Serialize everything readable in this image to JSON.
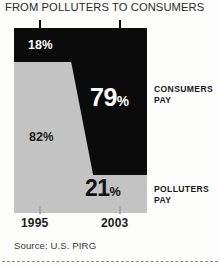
{
  "title": "FROM POLLUTERS TO CONSUMERS",
  "source": "Source: U.S. PIRG",
  "callouts": {
    "consumers_line1": "CONSUMERS",
    "consumers_line2": "PAY",
    "polluters_line1": "POLLUTERS",
    "polluters_line2": "PAY"
  },
  "axis": {
    "year_start": "1995",
    "year_end": "2003"
  },
  "labels": {
    "consumers_1995": "18",
    "consumers_2003": "79",
    "polluters_1995": "82",
    "polluters_2003": "21",
    "percent_sign": "%"
  },
  "colors": {
    "consumers_band": "#0b0b0b",
    "polluters_band": "#c3c3c3",
    "background": "#fdfdfb",
    "text": "#1c1c1c"
  },
  "chart_data": {
    "type": "area",
    "title": "FROM POLLUTERS TO CONSUMERS",
    "subtitle": "",
    "xlabel": "",
    "ylabel": "",
    "x": [
      "1995",
      "2003"
    ],
    "categories": [
      "1995",
      "2003"
    ],
    "ylim": [
      0,
      100
    ],
    "stacked": true,
    "grid": false,
    "legend_position": "right",
    "annotations": [
      "18%",
      "79%",
      "82%",
      "21%",
      "CONSUMERS PAY",
      "POLLUTERS PAY"
    ],
    "series": [
      {
        "name": "CONSUMERS PAY",
        "values": [
          18,
          79
        ],
        "color": "#0b0b0b",
        "labels": [
          "18%",
          "79%"
        ]
      },
      {
        "name": "POLLUTERS PAY",
        "values": [
          82,
          21
        ],
        "color": "#c3c3c3",
        "labels": [
          "82%",
          "21%"
        ]
      }
    ],
    "source": "Source: U.S. PIRG"
  }
}
